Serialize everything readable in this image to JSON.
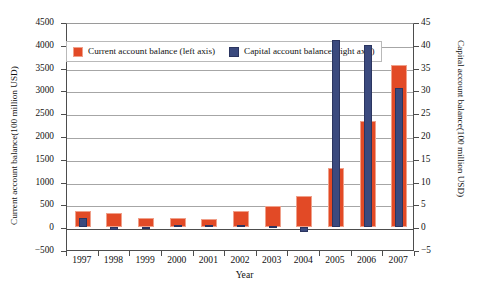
{
  "chart_data": {
    "type": "bar",
    "title": "",
    "xlabel": "Year",
    "ylabel": "Current account balance(100 million USD)",
    "ylabel_right": "Capital account balance(100 million USD)",
    "categories": [
      "1997",
      "1998",
      "1999",
      "2000",
      "2001",
      "2002",
      "2003",
      "2004",
      "2005",
      "2006",
      "2007"
    ],
    "ylim": [
      -500,
      4500
    ],
    "ylim_right": [
      -5,
      45
    ],
    "yticks": [
      4500,
      4000,
      3500,
      3000,
      2500,
      2000,
      1500,
      1000,
      500,
      0,
      -500
    ],
    "yticks_right": [
      45,
      40,
      35,
      30,
      25,
      20,
      15,
      10,
      5,
      0,
      -5
    ],
    "ytick_labels": [
      "4500",
      "4000",
      "3500",
      "3000",
      "2500",
      "2000",
      "1500",
      "1000",
      "500",
      "0",
      "−500"
    ],
    "ytick_labels_right": [
      "45",
      "40",
      "35",
      "30",
      "25",
      "20",
      "15",
      "10",
      "5",
      "0",
      "−5"
    ],
    "grid": true,
    "legend_position": "upper-left-inside",
    "series": [
      {
        "name": "Current account balance (left axis)",
        "axis": "left",
        "color": "#e24a26",
        "values": [
          357,
          315,
          211,
          205,
          174,
          354,
          459,
          687,
          1308,
          2330,
          3550
        ]
      },
      {
        "name": "Capital account balance (right axis)",
        "axis": "right",
        "color": "#3b4a7e",
        "values": [
          2.1,
          -0.6,
          -0.5,
          0.2,
          0.5,
          0.3,
          -0.1,
          -1.1,
          41.0,
          40.0,
          30.6
        ]
      }
    ]
  },
  "legend": {
    "items": [
      {
        "label": "Current account balance (left axis)",
        "swatch": "red-swatch-icon"
      },
      {
        "label": "Capital account balance (right axis)",
        "swatch": "blue-swatch-icon"
      }
    ]
  }
}
